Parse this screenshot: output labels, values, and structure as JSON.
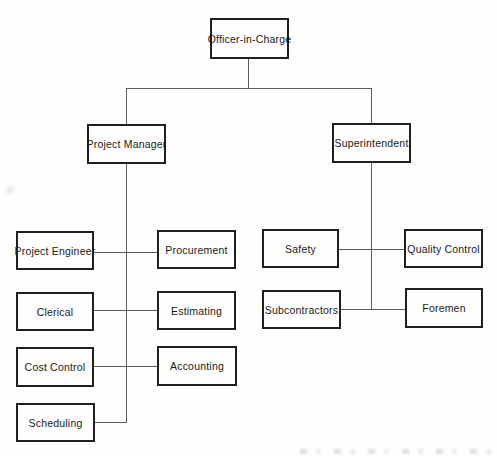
{
  "org_chart": {
    "type": "org-tree",
    "nodes": {
      "officer_in_charge": {
        "label": "Officer-in-Charge"
      },
      "project_manager": {
        "label": "Project Manager"
      },
      "superintendent": {
        "label": "Superintendent"
      },
      "project_engineer": {
        "label": "Project Engineer"
      },
      "procurement": {
        "label": "Procurement"
      },
      "clerical": {
        "label": "Clerical"
      },
      "estimating": {
        "label": "Estimating"
      },
      "cost_control": {
        "label": "Cost Control"
      },
      "accounting": {
        "label": "Accounting"
      },
      "scheduling": {
        "label": "Scheduling"
      },
      "safety": {
        "label": "Safety"
      },
      "quality_control": {
        "label": "Quality Control"
      },
      "subcontractors": {
        "label": "Subcontractors"
      },
      "foremen": {
        "label": "Foremen"
      }
    },
    "hierarchy": [
      {
        "parent": "Officer-in-Charge",
        "children": [
          "Project Manager",
          "Superintendent"
        ]
      },
      {
        "parent": "Project Manager",
        "children": [
          "Project Engineer",
          "Procurement",
          "Clerical",
          "Estimating",
          "Cost Control",
          "Accounting",
          "Scheduling"
        ]
      },
      {
        "parent": "Superintendent",
        "children": [
          "Safety",
          "Quality Control",
          "Subcontractors",
          "Foremen"
        ]
      }
    ],
    "colors": {
      "background": "#fefefd",
      "box_border": "#1f1f1f",
      "text": "#1a1a1a",
      "line": "#5c5c5c"
    }
  }
}
